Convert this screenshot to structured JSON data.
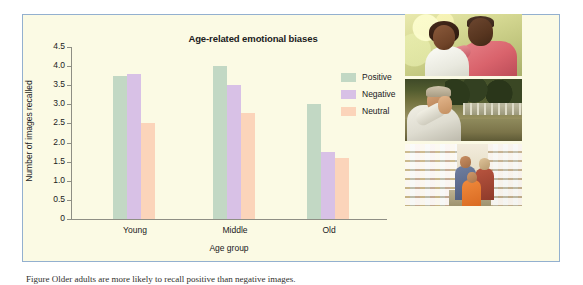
{
  "figure": {
    "caption": "Figure  Older adults are more likely to recall positive than negative images."
  },
  "chart_data": {
    "type": "bar",
    "title": "Age-related emotional biases",
    "xlabel": "Age group",
    "ylabel": "Number of images recalled",
    "categories": [
      "Young",
      "Middle",
      "Old"
    ],
    "series": [
      {
        "name": "Positive",
        "color": "#c2d8c4",
        "values": [
          3.75,
          4.0,
          3.0
        ]
      },
      {
        "name": "Negative",
        "color": "#d8c1e6",
        "values": [
          3.8,
          3.5,
          1.75
        ]
      },
      {
        "name": "Neutral",
        "color": "#fbd4ba",
        "values": [
          2.5,
          2.78,
          1.6
        ]
      }
    ],
    "ylim": [
      0,
      4.5
    ],
    "ytick_step": 0.5,
    "ytick_labels": [
      "4.5",
      "4.0",
      "3.5",
      "3.0",
      "2.5",
      "2.0",
      "1.5",
      "1.0",
      "0.5",
      "0"
    ],
    "grid": false,
    "legend_position": "right"
  },
  "legend": {
    "items": [
      {
        "label": "Positive"
      },
      {
        "label": "Negative"
      },
      {
        "label": "Neutral"
      }
    ]
  },
  "photos": [
    {
      "alt": "older-man-and-young-girl-smiling"
    },
    {
      "alt": "man-with-hand-on-face-outdoors"
    },
    {
      "alt": "family-shopping-in-supermarket-aisle"
    }
  ]
}
